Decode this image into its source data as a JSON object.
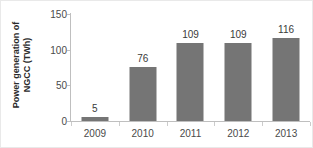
{
  "chart_data": {
    "type": "bar",
    "title": "",
    "subtitle": "",
    "categories": [
      "2009",
      "2010",
      "2011",
      "2012",
      "2013"
    ],
    "values": [
      5,
      76,
      109,
      109,
      116
    ],
    "data_labels": [
      "5",
      "76",
      "109",
      "109",
      "116"
    ],
    "xlabel": "",
    "ylabel": "Power generation of NGCC (TWh)",
    "ylabel_line1": "Power generation of",
    "ylabel_line2": "NGCC (TWh)",
    "ylim": [
      0,
      150
    ],
    "yticks": [
      150,
      100,
      50,
      0
    ],
    "ytick_labels": [
      "150",
      "100",
      "50",
      "0"
    ],
    "grid": false,
    "legend": null,
    "legend_position": "none",
    "bar_color": "#757575",
    "axis_color": "#bfbfbf",
    "text_color": "#4a4a4a",
    "background": "#ffffff"
  }
}
